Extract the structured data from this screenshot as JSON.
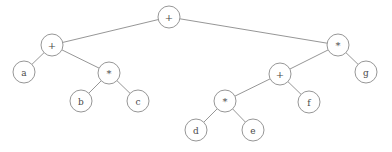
{
  "figure": {
    "background_color": "#ffffff",
    "stroke_color": "#8a8a8a",
    "text_color": "#4a4a4a",
    "width": 392,
    "height": 152
  },
  "tree": {
    "nodes": [
      {
        "id": "n0",
        "label": "+",
        "kind": "operator",
        "x": 169,
        "y": 17,
        "r": 11
      },
      {
        "id": "n1",
        "label": "+",
        "kind": "operator",
        "x": 52,
        "y": 45,
        "r": 11
      },
      {
        "id": "n2",
        "label": "*",
        "kind": "operator",
        "x": 338,
        "y": 45,
        "r": 11
      },
      {
        "id": "n3",
        "label": "a",
        "kind": "operand",
        "x": 24,
        "y": 72,
        "r": 11
      },
      {
        "id": "n4",
        "label": "*",
        "kind": "operator",
        "x": 109,
        "y": 73,
        "r": 11
      },
      {
        "id": "n5",
        "label": "b",
        "kind": "operand",
        "x": 81,
        "y": 101,
        "r": 11
      },
      {
        "id": "n6",
        "label": "c",
        "kind": "operand",
        "x": 138,
        "y": 101,
        "r": 11
      },
      {
        "id": "n7",
        "label": "+",
        "kind": "operator",
        "x": 280,
        "y": 74,
        "r": 11
      },
      {
        "id": "n8",
        "label": "g",
        "kind": "operand",
        "x": 366,
        "y": 72,
        "r": 11
      },
      {
        "id": "n9",
        "label": "*",
        "kind": "operator",
        "x": 225,
        "y": 101,
        "r": 11
      },
      {
        "id": "n10",
        "label": "f",
        "kind": "operand",
        "x": 309,
        "y": 102,
        "r": 11
      },
      {
        "id": "n11",
        "label": "d",
        "kind": "operand",
        "x": 196,
        "y": 130,
        "r": 11
      },
      {
        "id": "n12",
        "label": "e",
        "kind": "operand",
        "x": 253,
        "y": 130,
        "r": 11
      }
    ],
    "edges": [
      {
        "from": "n0",
        "to": "n1"
      },
      {
        "from": "n0",
        "to": "n2"
      },
      {
        "from": "n1",
        "to": "n3"
      },
      {
        "from": "n1",
        "to": "n4"
      },
      {
        "from": "n4",
        "to": "n5"
      },
      {
        "from": "n4",
        "to": "n6"
      },
      {
        "from": "n2",
        "to": "n7"
      },
      {
        "from": "n2",
        "to": "n8"
      },
      {
        "from": "n7",
        "to": "n9"
      },
      {
        "from": "n7",
        "to": "n10"
      },
      {
        "from": "n9",
        "to": "n11"
      },
      {
        "from": "n9",
        "to": "n12"
      }
    ]
  }
}
